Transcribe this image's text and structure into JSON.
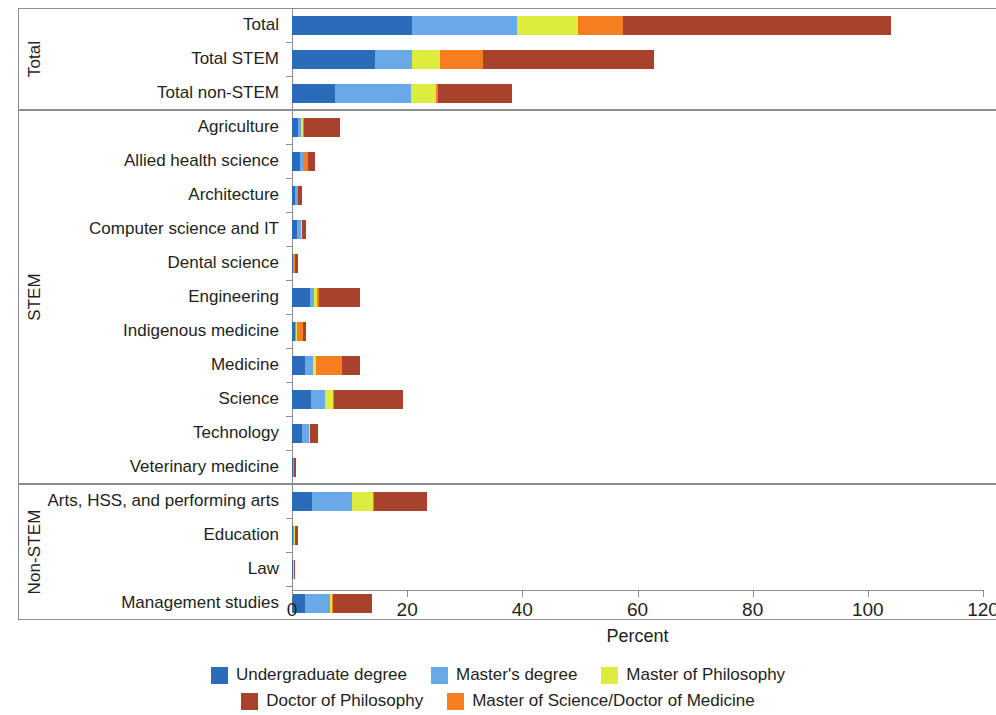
{
  "chart_data": {
    "type": "bar",
    "orientation": "horizontal",
    "stacked": true,
    "title": "",
    "xlabel": "Percent",
    "ylabel": "",
    "xlim": [
      0,
      120
    ],
    "xticks": [
      0,
      20,
      40,
      60,
      80,
      100,
      120
    ],
    "grid": false,
    "legend_position": "bottom",
    "series": [
      {
        "name": "Undergraduate degree",
        "color": "#2b6cb8",
        "values": [
          20.8,
          14.4,
          7.5,
          1.0,
          1.4,
          0.5,
          0.9,
          0.2,
          3.1,
          0.5,
          2.2,
          3.3,
          1.7,
          0.1,
          3.4,
          0.2,
          0.1,
          2.3
        ]
      },
      {
        "name": "Master's degree",
        "color": "#6aa9e8",
        "values": [
          18.2,
          6.4,
          13.2,
          0.5,
          0.5,
          0.3,
          0.6,
          0.1,
          0.8,
          0.2,
          1.4,
          2.4,
          1.2,
          0.1,
          7.0,
          0.2,
          0.1,
          4.3
        ]
      },
      {
        "name": "Master of Philosophy",
        "color": "#ddec3f",
        "values": [
          10.6,
          4.9,
          4.3,
          0.4,
          0.1,
          0.1,
          0.2,
          0.0,
          0.5,
          0.1,
          0.5,
          1.4,
          0.2,
          0.0,
          3.7,
          0.1,
          0.1,
          0.4
        ]
      },
      {
        "name": "Master of Science/Doctor of Medicine",
        "color": "#f57f20",
        "values": [
          7.9,
          7.5,
          0.4,
          0.2,
          0.7,
          0.1,
          0.1,
          0.3,
          0.3,
          1.1,
          4.6,
          0.2,
          0.1,
          0.1,
          0.2,
          0.1,
          0.0,
          0.1
        ]
      },
      {
        "name": "Doctor of Philosophy",
        "color": "#a8422c",
        "values": [
          46.5,
          29.6,
          12.8,
          6.2,
          1.3,
          0.7,
          0.6,
          0.5,
          7.1,
          0.6,
          3.1,
          11.9,
          1.3,
          0.4,
          9.1,
          0.5,
          0.2,
          6.8
        ]
      }
    ],
    "groups": [
      {
        "label": "Total",
        "categories": [
          "Total",
          "Total STEM",
          "Total non-STEM"
        ]
      },
      {
        "label": "STEM",
        "categories": [
          "Agriculture",
          "Allied health science",
          "Architecture",
          "Computer science and IT",
          "Dental science",
          "Engineering",
          "Indigenous medicine",
          "Medicine",
          "Science",
          "Technology",
          "Veterinary medicine"
        ]
      },
      {
        "label": "Non-STEM",
        "categories": [
          "Arts, HSS, and performing arts",
          "Education",
          "Law",
          "Management studies"
        ]
      }
    ],
    "categories": [
      "Total",
      "Total STEM",
      "Total non-STEM",
      "Agriculture",
      "Allied health science",
      "Architecture",
      "Computer science and IT",
      "Dental science",
      "Engineering",
      "Indigenous medicine",
      "Medicine",
      "Science",
      "Technology",
      "Veterinary medicine",
      "Arts, HSS, and performing arts",
      "Education",
      "Law",
      "Management studies"
    ],
    "totals": [
      104.0,
      62.8,
      38.2,
      8.3,
      4.0,
      1.7,
      2.4,
      1.1,
      11.8,
      2.5,
      11.8,
      19.2,
      4.5,
      0.7,
      23.4,
      1.1,
      0.5,
      13.9
    ]
  }
}
